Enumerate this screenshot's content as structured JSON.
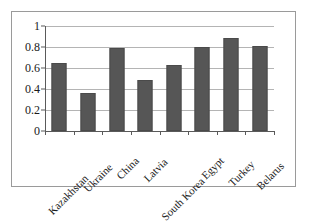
{
  "chart_data": {
    "type": "bar",
    "title": "",
    "subtitle": "",
    "xlabel": "",
    "ylabel": "",
    "categories": [
      "Kazakhstan",
      "Ukraine",
      "China",
      "Latvia",
      "South Korea",
      "Egypt",
      "Turkey",
      "Belarus"
    ],
    "values": [
      0.65,
      0.36,
      0.79,
      0.49,
      0.63,
      0.8,
      0.89,
      0.81
    ],
    "series": [
      {
        "name": "",
        "values": [
          0.65,
          0.36,
          0.79,
          0.49,
          0.63,
          0.8,
          0.89,
          0.81
        ]
      }
    ],
    "ylim": [
      0,
      1
    ],
    "yticks": [
      "0",
      "0.2",
      "0.4",
      "0.6",
      "0.8",
      "1"
    ],
    "ytick_values": [
      0,
      0.2,
      0.4,
      0.6,
      0.8,
      1
    ],
    "grid": true,
    "grid_axis": "y",
    "legend": false,
    "legend_position": "none",
    "annotations": [],
    "colors": {
      "bar_fill": "#565656",
      "bar_border": "#4a4a4a",
      "gridline": "#b4b4b4",
      "axis": "#5a5a5a",
      "frame_border": "#9a9a9a",
      "background": "#ffffff",
      "text": "#1a1a1a"
    },
    "xlabel_rotation_deg": -45
  }
}
